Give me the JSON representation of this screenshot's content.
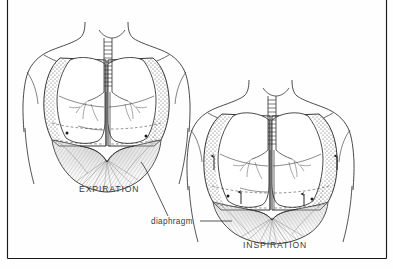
{
  "figure": {
    "kind": "anatomical-illustration",
    "style": "black-and-white line drawing with stipple and hatch shading",
    "frame": {
      "left_rule": true,
      "right_rule": true,
      "bottom_rule": true,
      "top_rule": false,
      "color": "#1a1a1a"
    },
    "background_color": "#fefefe",
    "ink_color": "#2b2b2b"
  },
  "labels": {
    "expiration": "EXPIRATION",
    "inspiration": "INSPIRATION",
    "diaphragm": "diaphragm"
  },
  "panels": [
    {
      "id": "left",
      "label": "EXPIRATION",
      "description": "Thorax at rest, diaphragm domed upward, ribcage lowered",
      "diaphragm_state": "raised-dome",
      "arrows": 0
    },
    {
      "id": "right",
      "label": "INSPIRATION",
      "description": "Thorax expanded, diaphragm flattened and descended, ribcage elevated",
      "diaphragm_state": "flattened-descended",
      "arrows": 4,
      "arrow_direction": "up"
    }
  ],
  "anatomy_parts": [
    "trachea",
    "right-lung",
    "left-lung",
    "bronchial-tree",
    "ribcage",
    "diaphragm",
    "neck",
    "shoulders",
    "torso-outline"
  ],
  "leader_lines": [
    {
      "from": "diaphragm-label",
      "to": "left-panel-diaphragm"
    },
    {
      "from": "diaphragm-label",
      "to": "right-panel-diaphragm"
    }
  ]
}
